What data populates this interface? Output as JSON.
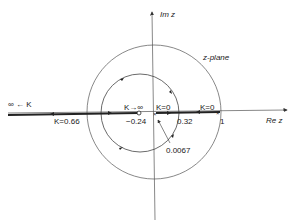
{
  "diagram": {
    "plane_label": "z-plane",
    "axes": {
      "real": "Re z",
      "imag": "Im z"
    },
    "labels": {
      "inf_to_k": "∞ ← K",
      "k_066": "K=0.66",
      "k_inf": "K→∞",
      "k0_left": "K=0",
      "k0_right": "K=0",
      "v_neg024": "−0.24",
      "v_032": "0.32",
      "v_1": "1",
      "v_00067": "0.0067"
    },
    "points": {
      "zero": -0.24,
      "poles": [
        0.0067,
        1
      ],
      "breakaway": 0.32,
      "breakin": -0.66
    },
    "colors": {
      "line": "#333333",
      "background": "#ffffff"
    }
  }
}
